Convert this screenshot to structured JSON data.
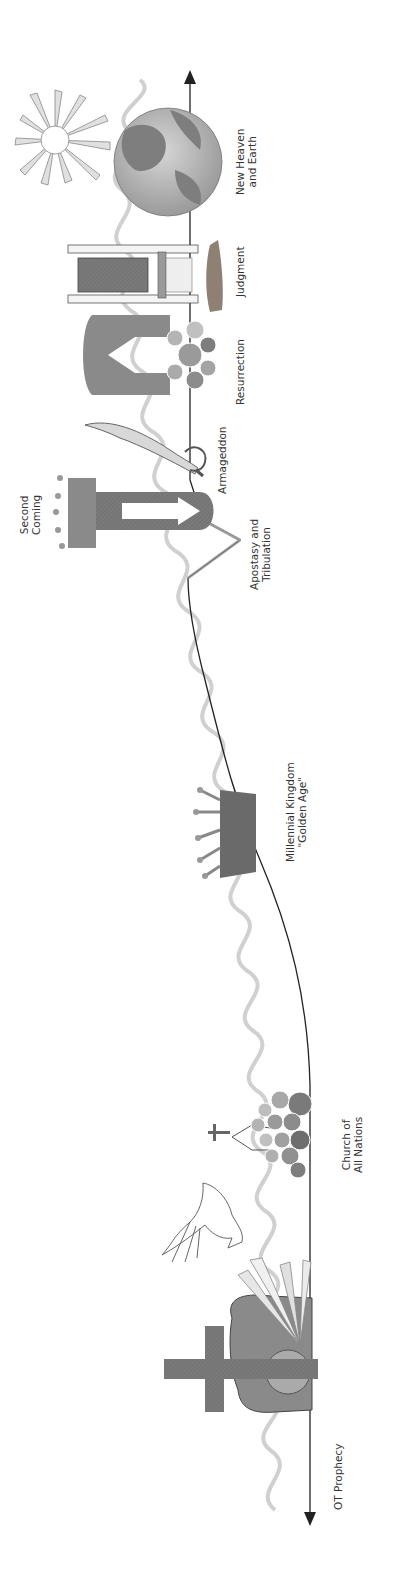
{
  "diagram": {
    "title": "",
    "orientation": "rotated-90-ccw",
    "colors": {
      "background": "#ffffff",
      "timeline": "#222222",
      "spiral": "#cfcfcf",
      "dark_icon": "#6e6e6e",
      "mid_icon": "#9a9a9a",
      "light_icon": "#c8c8c8",
      "label": "#333333"
    },
    "events": [
      {
        "id": "ot-prophecy",
        "label_lines": [
          "OT Prophecy"
        ],
        "icon": "arrow-start"
      },
      {
        "id": "cross-resurrection",
        "label_lines": [],
        "icon": "cross-and-tomb-icon"
      },
      {
        "id": "pentecost",
        "label_lines": [],
        "icon": "dove-icon"
      },
      {
        "id": "church",
        "label_lines": [
          "Church of",
          "All Nations"
        ],
        "icon": "church-crowd-icon"
      },
      {
        "id": "millennium",
        "label_lines": [
          "Millennial Kingdom",
          "\"Golden Age\""
        ],
        "icon": "crown-icon"
      },
      {
        "id": "apostasy",
        "label_lines": [
          "Apostasy and",
          "Tribulation"
        ],
        "icon": "dip-notch"
      },
      {
        "id": "second-coming",
        "label_lines": [
          "Second",
          "Coming"
        ],
        "icon": "crown-arrow-icon"
      },
      {
        "id": "armageddon",
        "label_lines": [
          "Armageddon"
        ],
        "icon": "sword-icon"
      },
      {
        "id": "resurrection",
        "label_lines": [
          "Resurrection"
        ],
        "icon": "rising-arrow-crowd-icon"
      },
      {
        "id": "judgment",
        "label_lines": [
          "Judgment"
        ],
        "icon": "throne-icon"
      },
      {
        "id": "new-heaven-earth",
        "label_lines": [
          "New Heaven",
          "and Earth"
        ],
        "icon": "globe-sun-icon"
      }
    ]
  }
}
